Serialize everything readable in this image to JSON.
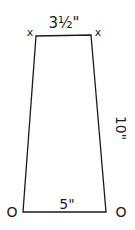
{
  "diagram": {
    "shape": "trapezoid",
    "stroke_color": "#1a1a1a",
    "background": "#ffffff",
    "vertices": {
      "top_left": [
        36,
        36
      ],
      "top_right": [
        91,
        35
      ],
      "bottom_right": [
        106,
        212
      ],
      "bottom_left": [
        23,
        212
      ]
    },
    "labels": {
      "top_width": "3½\"",
      "side_height": "10\"",
      "bottom_width": "5\""
    },
    "markers": {
      "top_left": "x",
      "top_right": "x",
      "bottom_left": "O",
      "bottom_right": "O"
    }
  }
}
